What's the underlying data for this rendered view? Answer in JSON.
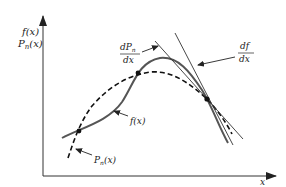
{
  "figure": {
    "y_axis_label_top": "f(x)",
    "y_axis_label_bottom": "P",
    "y_axis_label_bottom_sub": "n",
    "y_axis_label_bottom_arg": "(x)",
    "x_axis_label": "x",
    "curve_f_label": "f(x)",
    "curve_p_label": "P",
    "curve_p_label_sub": "n",
    "curve_p_label_arg": "(x)",
    "derivative_p_num": "dP",
    "derivative_p_num_sub": "n",
    "derivative_p_den": "dx",
    "derivative_f_num": "df",
    "derivative_f_den": "dx",
    "colors": {
      "axis": "#333333",
      "solid_curve": "#555555",
      "dashed_curve": "#111111",
      "tangent": "#333333"
    }
  }
}
